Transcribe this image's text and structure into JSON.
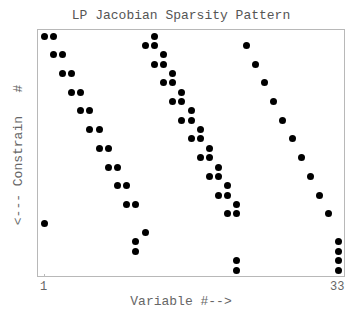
{
  "chart_data": {
    "type": "scatter",
    "title": "LP Jacobian Sparsity Pattern",
    "xlabel": "Variable #-->",
    "ylabel": "<--- Constrain   #",
    "x_ticks": [
      "1",
      "33"
    ],
    "xlim": [
      1,
      33
    ],
    "ylim": [
      1,
      26
    ],
    "y_inverted": true,
    "grid": false,
    "legend": null,
    "points": [
      [
        1,
        1
      ],
      [
        2,
        1
      ],
      [
        13,
        1
      ],
      [
        12,
        2
      ],
      [
        13,
        2
      ],
      [
        23,
        2
      ],
      [
        2,
        3
      ],
      [
        3,
        3
      ],
      [
        14,
        3
      ],
      [
        13,
        4
      ],
      [
        14,
        4
      ],
      [
        24,
        4
      ],
      [
        3,
        5
      ],
      [
        4,
        5
      ],
      [
        15,
        5
      ],
      [
        14,
        6
      ],
      [
        15,
        6
      ],
      [
        25,
        6
      ],
      [
        4,
        7
      ],
      [
        5,
        7
      ],
      [
        16,
        7
      ],
      [
        15,
        8
      ],
      [
        16,
        8
      ],
      [
        26,
        8
      ],
      [
        5,
        9
      ],
      [
        6,
        9
      ],
      [
        17,
        9
      ],
      [
        16,
        10
      ],
      [
        17,
        10
      ],
      [
        27,
        10
      ],
      [
        6,
        11
      ],
      [
        7,
        11
      ],
      [
        18,
        11
      ],
      [
        17,
        12
      ],
      [
        18,
        12
      ],
      [
        28,
        12
      ],
      [
        7,
        13
      ],
      [
        8,
        13
      ],
      [
        19,
        13
      ],
      [
        18,
        14
      ],
      [
        19,
        14
      ],
      [
        29,
        14
      ],
      [
        8,
        15
      ],
      [
        9,
        15
      ],
      [
        20,
        15
      ],
      [
        19,
        16
      ],
      [
        20,
        16
      ],
      [
        30,
        16
      ],
      [
        9,
        17
      ],
      [
        10,
        17
      ],
      [
        21,
        17
      ],
      [
        20,
        18
      ],
      [
        21,
        18
      ],
      [
        31,
        18
      ],
      [
        10,
        19
      ],
      [
        11,
        19
      ],
      [
        22,
        19
      ],
      [
        21,
        20
      ],
      [
        22,
        20
      ],
      [
        32,
        20
      ],
      [
        1,
        21
      ],
      [
        12,
        22
      ],
      [
        11,
        23
      ],
      [
        33,
        23
      ],
      [
        11,
        24
      ],
      [
        33,
        24
      ],
      [
        22,
        25
      ],
      [
        33,
        25
      ],
      [
        22,
        26
      ],
      [
        33,
        26
      ]
    ]
  }
}
